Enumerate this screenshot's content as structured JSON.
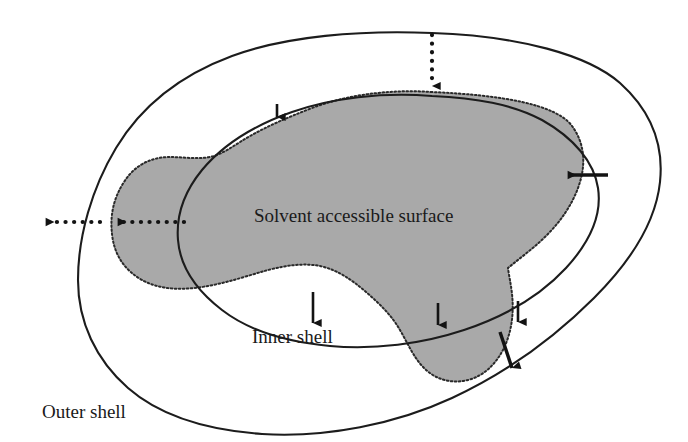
{
  "figure": {
    "background_color": "#ffffff",
    "width": 688,
    "height": 442
  },
  "labels": {
    "solvent_accessible_surface": "Solvent accessible surface",
    "inner_shell": "Inner shell",
    "outer_shell": "Outer shell"
  },
  "colors": {
    "surface_fill": "#a9a9a9",
    "line_stroke": "#1c1c1c",
    "arrow_stroke": "#131313",
    "text": "#1a1a1a"
  },
  "regions": [
    {
      "name": "solvent-accessible-surface",
      "style": "gray filled blob with dotted outline",
      "fill": "#a9a9a9",
      "outline": "dotted"
    },
    {
      "name": "inner-shell",
      "style": "solid thin closed curve",
      "fill": "none",
      "outline": "solid"
    },
    {
      "name": "outer-shell",
      "style": "solid thin closed curve, outermost",
      "fill": "none",
      "outline": "solid"
    }
  ],
  "annotations": [
    {
      "name": "arrow-top-dotted-down",
      "style": "dotted",
      "direction": "down",
      "from": [
        432,
        33
      ],
      "to": [
        432,
        92
      ]
    },
    {
      "name": "arrow-left-dotted-right",
      "style": "dotted",
      "direction": "right",
      "from": [
        48,
        222
      ],
      "to": [
        108,
        222
      ]
    },
    {
      "name": "arrow-left-dotted-left",
      "style": "dotted",
      "direction": "left",
      "from": [
        182,
        222
      ],
      "to": [
        112,
        222
      ]
    },
    {
      "name": "arrow-right-solid-left",
      "style": "solid",
      "direction": "left",
      "from": [
        604,
        175
      ],
      "to": [
        564,
        175
      ]
    },
    {
      "name": "arrow-top-left-small-down",
      "style": "solid",
      "direction": "down",
      "from": [
        277,
        103
      ],
      "to": [
        277,
        122
      ]
    },
    {
      "name": "arrow-inner-shell-up",
      "style": "solid",
      "direction": "up",
      "from": [
        313,
        322
      ],
      "to": [
        313,
        287
      ]
    },
    {
      "name": "arrow-bottom-left-small-down",
      "style": "solid",
      "direction": "down",
      "from": [
        438,
        306
      ],
      "to": [
        438,
        330
      ]
    },
    {
      "name": "arrow-bottom-right-small-up",
      "style": "solid",
      "direction": "up",
      "from": [
        518,
        320
      ],
      "to": [
        518,
        296
      ]
    },
    {
      "name": "arrow-bottom-right-down",
      "style": "solid",
      "direction": "down",
      "from": [
        502,
        334
      ],
      "to": [
        512,
        374
      ]
    }
  ]
}
